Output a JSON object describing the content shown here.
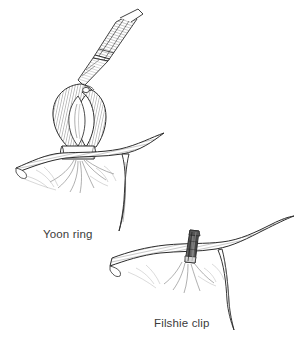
{
  "figure": {
    "kind": "medical-line-illustration",
    "background_color": "#ffffff",
    "ink_color": "#2b2b2b",
    "label_color": "#3b3b3b",
    "panels": [
      {
        "id": "yoon-ring",
        "caption": "Yoon ring",
        "caption_position": {
          "x": 43,
          "y": 228
        },
        "elements": [
          "applicator-shaft",
          "tube-knuckle-loop",
          "silastic-ring-band",
          "fallopian-tube",
          "mesosalpinx"
        ]
      },
      {
        "id": "filshie-clip",
        "caption": "Filshie clip",
        "caption_position": {
          "x": 154,
          "y": 317
        },
        "elements": [
          "fallopian-tube",
          "filshie-clip-body",
          "mesosalpinx",
          "tube-branch"
        ]
      }
    ]
  },
  "labels": {
    "yoon_ring": "Yoon ring",
    "filshie_clip": "Filshie clip"
  },
  "colors": {
    "background": "#ffffff",
    "ink": "#2b2b2b",
    "hatch": "#4a4a4a",
    "light_hatch": "#8e8e8e",
    "clip_dark": "#3a3a3a",
    "clip_mid": "#6e6e6e",
    "clip_light": "#c9c9c9",
    "ring_fill": "#ffffff",
    "caption": "#3b3b3b"
  }
}
